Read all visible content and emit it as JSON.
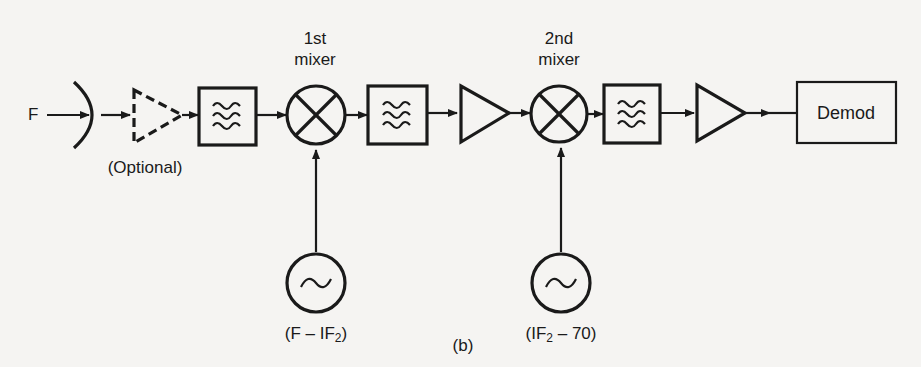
{
  "figure": {
    "caption": "(b)",
    "input_label": "F",
    "optional_label": "(Optional)",
    "mixer1": {
      "line1": "1st",
      "line2": "mixer"
    },
    "mixer2": {
      "line1": "2nd",
      "line2": "mixer"
    },
    "lo1": {
      "label_pre": "(F – IF",
      "label_sub": "2",
      "label_post": ")"
    },
    "lo2": {
      "label_pre": "(IF",
      "label_sub": "2",
      "label_post": " – 70)"
    },
    "demod_label": "Demod",
    "chain": [
      "antenna",
      "optional-amplifier",
      "bandpass-filter",
      "1st-mixer",
      "bandpass-filter",
      "amplifier",
      "2nd-mixer",
      "bandpass-filter",
      "amplifier",
      "demodulator"
    ]
  }
}
